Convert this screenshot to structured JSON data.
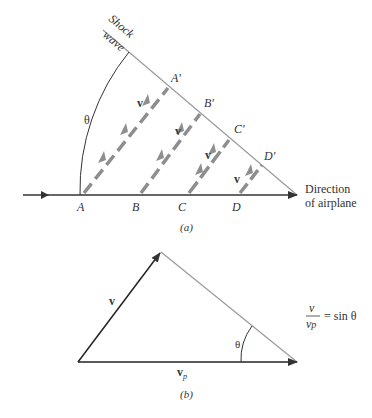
{
  "figure_a": {
    "caption": "(a)",
    "shock_label_1": "Shock",
    "shock_label_2": "wave",
    "angle_label": "θ",
    "velocity_label": "v",
    "points_bottom": [
      "A",
      "B",
      "C",
      "D"
    ],
    "points_top": [
      "A'",
      "B'",
      "C'",
      "D'"
    ],
    "direction_label_1": "Direction",
    "direction_label_2": "of airplane"
  },
  "figure_b": {
    "caption": "(b)",
    "vector_v_label": "v",
    "vector_vp_label": "v",
    "vector_vp_sub": "p",
    "angle_label": "θ",
    "equation": {
      "numerator": "v",
      "denominator_main": "v",
      "denominator_sub": "p",
      "rhs": "= sin θ"
    }
  },
  "colors": {
    "line_dark": "#333333",
    "line_light": "#9a9a9a",
    "arrow_gray": "#8e8e8e"
  }
}
